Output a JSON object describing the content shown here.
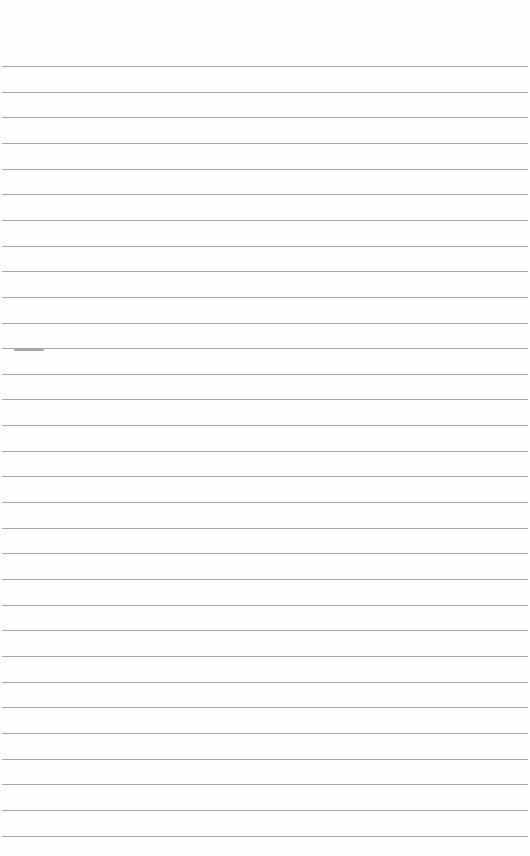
{
  "page": {
    "type": "ruled-notebook-page",
    "background_color": "#fefefe",
    "line_color": "#a9a9a9",
    "line_count": 31,
    "first_line_y": 66,
    "line_spacing": 25.65
  }
}
